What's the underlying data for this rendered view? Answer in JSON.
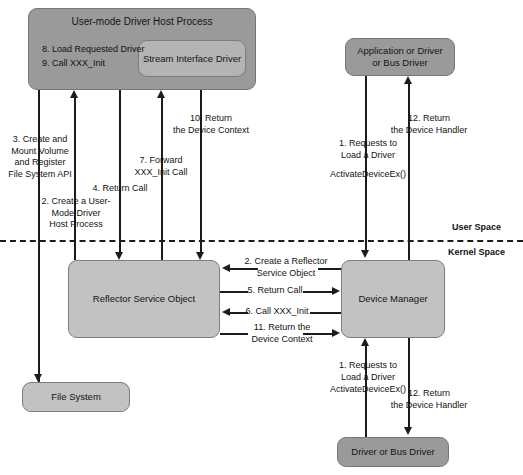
{
  "diagram": {
    "colors": {
      "box_dark": "#9a9a9a",
      "box_mid": "#b4b4b4",
      "box_light": "#c2c2c2",
      "line": "#1c1c1c",
      "background": "#ffffff"
    },
    "boxes": {
      "host_process": "User-mode Driver Host Process",
      "stream_interface_driver": "Stream Interface Driver",
      "application_or_driver": "Application or Driver\nor Bus Driver",
      "reflector_service_object": "Reflector Service Object",
      "device_manager": "Device Manager",
      "file_system": "File System",
      "driver_or_bus_driver": "Driver or Bus Driver"
    },
    "host_steps": {
      "step8": "8. Load Requested Driver",
      "step9": "9. Call XXX_Init"
    },
    "labels": {
      "step3": "3. Create and\nMount Volume\nand Register\nFile System API",
      "step2_left": "2. Create a User-\nMode Driver\nHost Process",
      "step4": "4. Return Call",
      "step7": "7. Forward\nXXX_Init Call",
      "step10": "10. Return\nthe Device Context",
      "step1_upper": "1. Requests to\nLoad a Driver",
      "step1_upper_api": "ActivateDeviceEx()",
      "step12_upper": "12. Return\nthe Device Handler",
      "step2_mid": "2. Create a Reflector\nService Object",
      "step5_mid": "5. Return Call",
      "step6_mid": "6. Call XXX_Init",
      "step11_mid": "11. Return the\nDevice Context",
      "step1_lower": "1. Requests to\nLoad a Driver",
      "step1_lower_api": "ActivateDeviceEx()",
      "step12_lower": "12. Return\nthe Device Handler"
    },
    "spaces": {
      "user_space": "User Space",
      "kernel_space": "Kernel Space"
    }
  }
}
